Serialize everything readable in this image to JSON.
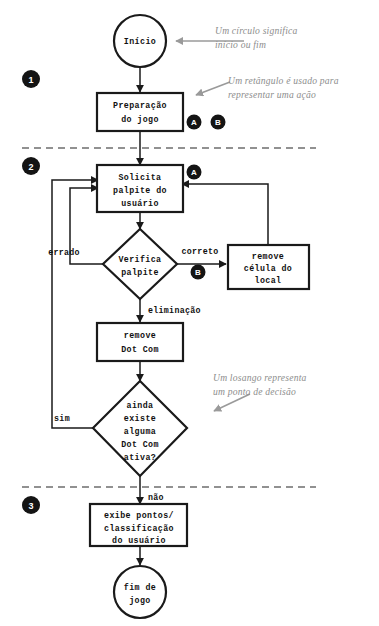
{
  "diagram": {
    "language": "pt-BR",
    "colors": {
      "shape_stroke": "#1a1a1a",
      "shape_fill": "#ffffff",
      "connector": "#1a1a1a",
      "divider": "#6e6e6e",
      "note_text": "#8d8d8d",
      "badge_fill": "#141414",
      "badge_text": "#ffffff",
      "background": "#ffffff"
    }
  },
  "nodes": {
    "start": {
      "shape": "circle",
      "label": "Início"
    },
    "setup": {
      "shape": "rectangle",
      "line1": "Preparação",
      "line2": "do jogo"
    },
    "ask_guess": {
      "shape": "rectangle",
      "line1": "Solicita",
      "line2": "palpite do",
      "line3": "usuário"
    },
    "check_guess": {
      "shape": "diamond",
      "line1": "Verifica",
      "line2": "palpite"
    },
    "remove_cell": {
      "shape": "rectangle",
      "line1": "remove",
      "line2": "célula do",
      "line3": "local"
    },
    "remove_dotcom": {
      "shape": "rectangle",
      "line1": "remove",
      "line2": "Dot Com"
    },
    "any_active": {
      "shape": "diamond",
      "line1": "ainda",
      "line2": "existe",
      "line3": "alguma",
      "line4": "Dot Com",
      "line5": "ativa?"
    },
    "show_score": {
      "shape": "rectangle",
      "line1": "exibe pontos/",
      "line2": "classificação",
      "line3": "do usuário"
    },
    "end": {
      "shape": "circle",
      "line1": "fim de",
      "line2": "jogo"
    }
  },
  "edge_labels": {
    "errado": "errado",
    "correto": "correto",
    "eliminacao": "eliminação",
    "sim": "sim",
    "nao": "não"
  },
  "stage_badges": [
    {
      "name": "stage-1",
      "label": "1"
    },
    {
      "name": "stage-2",
      "label": "2"
    },
    {
      "name": "stage-3",
      "label": "3"
    }
  ],
  "letter_badges": [
    {
      "name": "legend-badge-a",
      "label": "A"
    },
    {
      "name": "legend-badge-b",
      "label": "B"
    },
    {
      "name": "flow-badge-a",
      "label": "A"
    },
    {
      "name": "flow-badge-b",
      "label": "B"
    }
  ],
  "notes": {
    "circle_note": {
      "line1": "Um círculo significa",
      "line2": "início ou fim"
    },
    "rectangle_note": {
      "line1": "Um retângulo é usado para",
      "line2": "representar uma ação"
    },
    "diamond_note": {
      "line1": "Um losango representa",
      "line2": "um ponto de decisão"
    }
  }
}
